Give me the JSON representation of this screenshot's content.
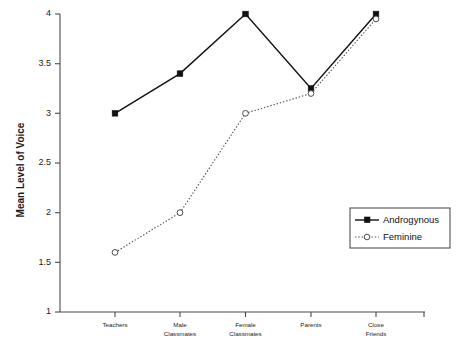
{
  "chart_data": {
    "type": "line",
    "title": "",
    "xlabel": "",
    "ylabel": "Mean Level of Voice",
    "ylim": [
      1,
      4
    ],
    "yticks": [
      1,
      1.5,
      2,
      2.5,
      3,
      3.5,
      4
    ],
    "ytick_labels": [
      "1",
      "1.5",
      "2",
      "2.5",
      "3",
      "3.5",
      "4"
    ],
    "grid": false,
    "legend_position": "center-right",
    "categories": [
      "Teachers",
      "Male Classmates",
      "Female Classmates",
      "Parents",
      "Close Friends"
    ],
    "category_lines": [
      [
        "Teachers"
      ],
      [
        "Male",
        "Classmates"
      ],
      [
        "Female",
        "Classmates"
      ],
      [
        "Parents"
      ],
      [
        "Close",
        "Friends"
      ]
    ],
    "series": [
      {
        "name": "Androgynous",
        "values": [
          3.0,
          3.4,
          4.0,
          3.25,
          4.0
        ],
        "line_style": "solid",
        "marker": "filled-square",
        "color": "#111111"
      },
      {
        "name": "Feminine",
        "values": [
          1.6,
          2.0,
          3.0,
          3.2,
          3.95
        ],
        "line_style": "dotted",
        "marker": "open-circle",
        "color": "#4d4d4d"
      }
    ]
  },
  "legend": {
    "entries": [
      {
        "label": "Androgynous"
      },
      {
        "label": "Feminine"
      }
    ]
  },
  "axes": {
    "y_title": "Mean Level of Voice"
  }
}
